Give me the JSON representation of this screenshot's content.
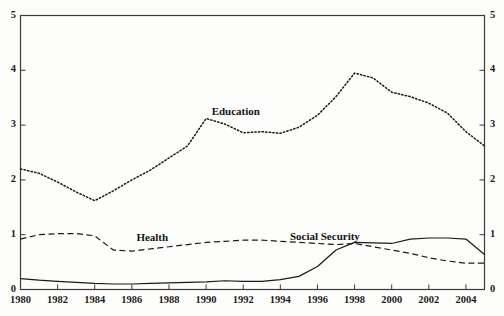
{
  "chart_data": {
    "type": "line",
    "title": "",
    "xlabel": "",
    "ylabel": "",
    "xlim": [
      1980,
      2005
    ],
    "ylim": [
      0,
      5
    ],
    "grid": false,
    "legend": "inline-annotations",
    "xticks": [
      "1980",
      "1982",
      "1984",
      "1986",
      "1988",
      "1990",
      "1992",
      "1994",
      "1996",
      "1998",
      "2000",
      "2002",
      "2004"
    ],
    "yticks_left": [
      "5",
      "4",
      "3",
      "2",
      "1",
      "0"
    ],
    "yticks_right": [
      "5",
      "4",
      "3",
      "2",
      "1",
      "0"
    ],
    "x": [
      1980,
      1981,
      1982,
      1983,
      1984,
      1985,
      1986,
      1987,
      1988,
      1989,
      1990,
      1991,
      1992,
      1993,
      1994,
      1995,
      1996,
      1997,
      1998,
      1999,
      2000,
      2001,
      2002,
      2003,
      2004,
      2005
    ],
    "series": [
      {
        "name": "Education",
        "style": "dotted",
        "color": "#1a1a1a",
        "label_x": 1991.6,
        "label_y": 3.22,
        "values": [
          2.2,
          2.12,
          1.96,
          1.78,
          1.62,
          1.8,
          2.0,
          2.18,
          2.4,
          2.62,
          3.12,
          3.02,
          2.86,
          2.88,
          2.85,
          2.96,
          3.18,
          3.52,
          3.95,
          3.86,
          3.6,
          3.52,
          3.4,
          3.22,
          2.88,
          2.62
        ]
      },
      {
        "name": "Health",
        "style": "dashed",
        "color": "#1a1a1a",
        "label_x": 1987.1,
        "label_y": 0.92,
        "values": [
          0.92,
          1.0,
          1.02,
          1.02,
          0.98,
          0.72,
          0.7,
          0.74,
          0.78,
          0.82,
          0.86,
          0.88,
          0.9,
          0.9,
          0.88,
          0.86,
          0.84,
          0.82,
          0.84,
          0.78,
          0.72,
          0.66,
          0.58,
          0.52,
          0.48,
          0.48
        ]
      },
      {
        "name": "Social Security",
        "style": "solid",
        "color": "#1a1a1a",
        "label_x": 1996.4,
        "label_y": 0.94,
        "values": [
          0.2,
          0.17,
          0.15,
          0.13,
          0.11,
          0.1,
          0.1,
          0.11,
          0.12,
          0.13,
          0.14,
          0.16,
          0.15,
          0.15,
          0.18,
          0.24,
          0.42,
          0.72,
          0.86,
          0.85,
          0.84,
          0.92,
          0.94,
          0.94,
          0.92,
          0.64
        ]
      }
    ]
  },
  "axes": {
    "left_ticks": [
      "5",
      "4",
      "3",
      "2",
      "1",
      "0"
    ],
    "right_ticks": [
      "5",
      "4",
      "3",
      "2",
      "1",
      "0"
    ],
    "x_ticks": [
      "1980",
      "1982",
      "1984",
      "1986",
      "1988",
      "1990",
      "1992",
      "1994",
      "1996",
      "1998",
      "2000",
      "2002",
      "2004"
    ]
  },
  "labels": {
    "education": "Education",
    "health": "Health",
    "social_security": "Social Security"
  }
}
